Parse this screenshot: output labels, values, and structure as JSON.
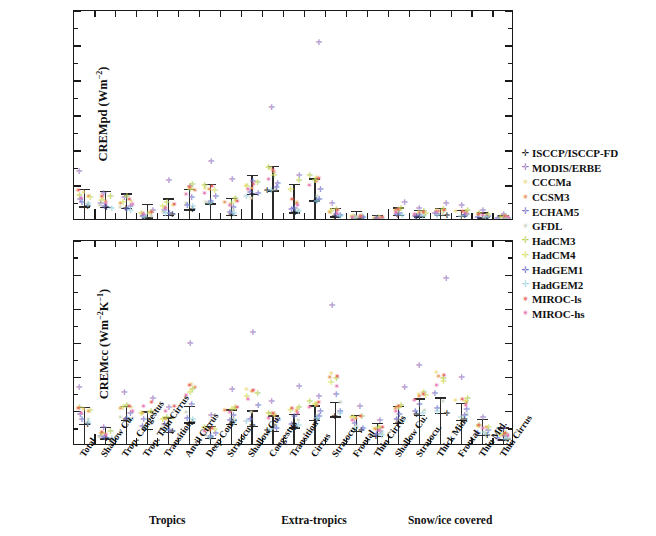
{
  "figure": {
    "panels": [
      {
        "id": "top",
        "ylabel": "CREMpd (Wm",
        "ylabel_sup": "-2",
        "ylabel_tail": ")",
        "ylabel_full": "CREMpd (Wm-2)",
        "yticks": [
          "0",
          "2",
          "4",
          "6",
          "8",
          "10",
          "12"
        ]
      },
      {
        "id": "bottom",
        "ylabel": "CREMcc (Wm",
        "ylabel_sup": "-2",
        "ylabel_mid": "K",
        "ylabel_sup2": "-1",
        "ylabel_tail": ")",
        "ylabel_full": "CREMcc (Wm-2K-1)",
        "yticks": [
          "0.00",
          "0.02",
          "0.04",
          "0.06",
          "0.08",
          "0.10",
          "0.12"
        ]
      }
    ],
    "group_titles": [
      "Tropics",
      "Extra-tropics",
      "Snow/ice covered"
    ],
    "categories": [
      "Total",
      "Shallow Cu.",
      "Trop. Congestus",
      "Trop. Thin Cirrus",
      "Transition",
      "Anvil Cirrus",
      "Deep Conv.",
      "Stratocu.",
      "Shallow Cu.",
      "Congestus",
      "Transition",
      "Cirrus",
      "Stratocu.",
      "Frontal",
      "Thin Cirrus",
      "Shallow Cu.",
      "Stratocu.",
      "Thick Mid.",
      "Frontal",
      "Thin Mid.",
      "Thin Cirrus"
    ]
  },
  "legend": {
    "entries": [
      {
        "label": "ISCCP/ISCCP-FD",
        "color": "#1a1a1a",
        "glyph": "✛"
      },
      {
        "label": "MODIS/ERBE",
        "color": "#9b79c4",
        "glyph": "✛"
      },
      {
        "label": "CCCMa",
        "color": "#ece08a",
        "glyph": "✴"
      },
      {
        "label": "CCSM3",
        "color": "#e8985c",
        "glyph": "✴"
      },
      {
        "label": "ECHAM5",
        "color": "#7a76c8",
        "glyph": "✛"
      },
      {
        "label": "GFDL",
        "color": "#cdd7c2",
        "glyph": "✴"
      },
      {
        "label": "HadCM3",
        "color": "#b7cf52",
        "glyph": "✛"
      },
      {
        "label": "HadCM4",
        "color": "#d4e05e",
        "glyph": "✛"
      },
      {
        "label": "HadGEM1",
        "color": "#6b6fd0",
        "glyph": "✛"
      },
      {
        "label": "HadGEM2",
        "color": "#9fd4e0",
        "glyph": "✛"
      },
      {
        "label": "MIROC-ls",
        "color": "#e8695f",
        "glyph": "✴"
      },
      {
        "label": "MIROC-hs",
        "color": "#e878b4",
        "glyph": "✴"
      }
    ]
  },
  "chart_data": {
    "type": "scatter",
    "title": "",
    "xlabel": "",
    "grid": false,
    "legend_position": "right",
    "model_order": [
      "ISCCP/ISCCP-FD",
      "MODIS/ERBE",
      "CCCMa",
      "CCSM3",
      "ECHAM5",
      "GFDL",
      "HadCM3",
      "HadCM4",
      "HadGEM1",
      "HadGEM2",
      "MIROC-ls",
      "MIROC-hs"
    ],
    "categories": [
      "Total",
      "Shallow Cu.",
      "Trop. Congestus",
      "Trop. Thin Cirrus",
      "Transition",
      "Anvil Cirrus",
      "Deep Conv.",
      "Stratocu.",
      "Shallow Cu.",
      "Congestus",
      "Transition",
      "Cirrus",
      "Stratocu.",
      "Frontal",
      "Thin Cirrus",
      "Shallow Cu.",
      "Stratocu.",
      "Thick Mid.",
      "Frontal",
      "Thin Mid.",
      "Thin Cirrus"
    ],
    "group_spans": [
      [
        0,
        0
      ],
      [
        1,
        7
      ],
      [
        8,
        14
      ],
      [
        15,
        20
      ]
    ],
    "panels": [
      {
        "name": "CREMpd",
        "ylabel": "CREMpd (Wm-2)",
        "ylim": [
          0,
          12
        ],
        "yticks": [
          0,
          2,
          4,
          6,
          8,
          10,
          12
        ],
        "mean": [
          0.8,
          0.78,
          0.7,
          0.18,
          0.32,
          0.62,
          0.98,
          0.33,
          1.5,
          1.72,
          0.45,
          1.15,
          0.22,
          0.14,
          0.08,
          0.3,
          0.22,
          0.3,
          0.26,
          0.17,
          0.1
        ],
        "err_low": [
          0.0,
          0.0,
          0.0,
          0.0,
          0.0,
          0.0,
          0.0,
          0.0,
          0.0,
          0.0,
          0.0,
          0.0,
          0.0,
          0.0,
          0.0,
          0.0,
          0.0,
          0.0,
          0.0,
          0.0,
          0.0
        ],
        "err_high": [
          1.8,
          1.7,
          1.55,
          0.95,
          1.25,
          1.8,
          2.1,
          1.3,
          2.6,
          3.1,
          2.1,
          2.4,
          0.7,
          0.55,
          0.3,
          0.75,
          0.6,
          0.7,
          0.6,
          0.45,
          0.28
        ],
        "points": [
          [
            0.8,
            2.8,
            1.6,
            1.35,
            1.2,
            0.95,
            1.45,
            1.3,
            1.05,
            0.9,
            1.7,
            1.25
          ],
          [
            0.75,
            1.55,
            1.25,
            1.1,
            0.95,
            0.85,
            1.35,
            1.15,
            0.8,
            0.7,
            1.4,
            1.0
          ],
          [
            0.7,
            1.3,
            1.1,
            1.0,
            0.8,
            0.72,
            1.4,
            1.05,
            0.65,
            0.58,
            1.2,
            0.9
          ],
          [
            0.18,
            0.6,
            0.42,
            0.38,
            0.3,
            0.25,
            0.48,
            0.4,
            0.22,
            0.2,
            0.45,
            0.33
          ],
          [
            0.32,
            2.3,
            0.85,
            0.75,
            0.55,
            0.48,
            1.05,
            0.8,
            0.42,
            0.38,
            0.92,
            0.68
          ],
          [
            0.62,
            1.95,
            1.85,
            1.7,
            1.3,
            0.95,
            2.05,
            1.75,
            0.88,
            0.8,
            1.9,
            1.5
          ],
          [
            0.98,
            3.35,
            1.85,
            1.75,
            1.4,
            1.05,
            2.0,
            1.7,
            1.1,
            0.95,
            1.95,
            1.55
          ],
          [
            0.33,
            2.35,
            1.15,
            1.05,
            0.72,
            0.6,
            1.25,
            1.0,
            0.45,
            0.4,
            1.1,
            0.85
          ],
          [
            1.5,
            2.25,
            2.0,
            1.85,
            1.55,
            1.25,
            2.15,
            1.95,
            1.6,
            1.35,
            2.05,
            1.75
          ],
          [
            1.72,
            6.45,
            2.95,
            2.75,
            2.1,
            1.8,
            3.05,
            2.6,
            1.9,
            1.7,
            2.85,
            2.35
          ],
          [
            0.45,
            2.55,
            1.05,
            0.95,
            0.7,
            0.55,
            2.3,
            1.8,
            0.62,
            0.5,
            1.2,
            0.88
          ],
          [
            1.15,
            10.2,
            2.45,
            2.25,
            1.75,
            1.4,
            2.55,
            2.3,
            1.2,
            1.1,
            2.4,
            2.0
          ],
          [
            0.22,
            0.95,
            0.55,
            0.48,
            0.35,
            0.3,
            0.62,
            0.52,
            0.28,
            0.25,
            0.58,
            0.42
          ],
          [
            0.14,
            0.18,
            0.22,
            0.2,
            0.16,
            0.15,
            0.25,
            0.21,
            0.15,
            0.14,
            0.23,
            0.19
          ],
          [
            0.08,
            0.12,
            0.14,
            0.13,
            0.1,
            0.09,
            0.16,
            0.13,
            0.09,
            0.08,
            0.15,
            0.12
          ],
          [
            0.3,
            1.05,
            0.62,
            0.55,
            0.4,
            0.35,
            0.68,
            0.58,
            0.33,
            0.3,
            0.65,
            0.48
          ],
          [
            0.22,
            0.7,
            0.45,
            0.4,
            0.3,
            0.26,
            0.5,
            0.42,
            0.25,
            0.23,
            0.47,
            0.36
          ],
          [
            0.3,
            1.0,
            0.58,
            0.52,
            0.38,
            0.33,
            0.64,
            0.55,
            0.32,
            0.29,
            0.6,
            0.46
          ],
          [
            0.26,
            0.85,
            0.5,
            0.45,
            0.33,
            0.29,
            0.55,
            0.47,
            0.28,
            0.25,
            0.52,
            0.4
          ],
          [
            0.17,
            0.58,
            0.34,
            0.3,
            0.23,
            0.2,
            0.38,
            0.32,
            0.19,
            0.17,
            0.36,
            0.27
          ],
          [
            0.1,
            0.35,
            0.2,
            0.18,
            0.14,
            0.12,
            0.23,
            0.19,
            0.12,
            0.1,
            0.21,
            0.16
          ]
        ]
      },
      {
        "name": "CREMcc",
        "ylabel": "CREMcc (Wm-2K-1)",
        "ylim": [
          0.0,
          0.12
        ],
        "yticks": [
          0.0,
          0.02,
          0.04,
          0.06,
          0.08,
          0.1,
          0.12
        ],
        "mean": [
          0.0125,
          0.004,
          0.015,
          0.0095,
          0.008,
          0.0135,
          0.0045,
          0.0125,
          0.0115,
          0.0085,
          0.0105,
          0.015,
          0.017,
          0.0085,
          0.0055,
          0.013,
          0.018,
          0.019,
          0.015,
          0.006,
          0.0035
        ],
        "err_low": [
          0.0,
          0.0,
          0.0,
          0.0,
          0.0,
          0.0,
          0.0,
          0.0,
          0.0,
          0.0,
          0.0,
          0.0,
          0.0,
          0.0,
          0.0,
          0.0,
          0.0,
          0.0,
          0.0,
          0.0,
          0.0
        ],
        "err_high": [
          0.0225,
          0.011,
          0.023,
          0.02,
          0.0165,
          0.023,
          0.0115,
          0.021,
          0.0205,
          0.0175,
          0.0185,
          0.0235,
          0.0255,
          0.018,
          0.013,
          0.023,
          0.0275,
          0.028,
          0.025,
          0.0155,
          0.0105
        ],
        "points": [
          [
            0.0125,
            0.034,
            0.021,
            0.02,
            0.018,
            0.0155,
            0.0225,
            0.0205,
            0.015,
            0.0135,
            0.0215,
            0.019
          ],
          [
            0.004,
            0.0105,
            0.0072,
            0.0065,
            0.0055,
            0.0048,
            0.008,
            0.0068,
            0.0045,
            0.0042,
            0.0075,
            0.006
          ],
          [
            0.015,
            0.031,
            0.0225,
            0.0215,
            0.019,
            0.0165,
            0.0235,
            0.022,
            0.016,
            0.0145,
            0.023,
            0.02
          ],
          [
            0.0095,
            0.0275,
            0.0195,
            0.0185,
            0.0155,
            0.013,
            0.02,
            0.019,
            0.011,
            0.01,
            0.025,
            0.023
          ],
          [
            0.008,
            0.0225,
            0.016,
            0.015,
            0.0125,
            0.0105,
            0.0165,
            0.0155,
            0.009,
            0.0085,
            0.023,
            0.02
          ],
          [
            0.0135,
            0.06,
            0.036,
            0.034,
            0.024,
            0.0195,
            0.033,
            0.031,
            0.016,
            0.015,
            0.035,
            0.029
          ],
          [
            0.0045,
            0.0175,
            0.0095,
            0.0088,
            0.007,
            0.0058,
            0.0105,
            0.0095,
            0.0052,
            0.0048,
            0.01,
            0.008
          ],
          [
            0.0125,
            0.033,
            0.0215,
            0.0205,
            0.0175,
            0.015,
            0.0225,
            0.021,
            0.0145,
            0.0135,
            0.022,
            0.0195
          ],
          [
            0.0115,
            0.066,
            0.033,
            0.0315,
            0.0235,
            0.0195,
            0.0305,
            0.0285,
            0.015,
            0.014,
            0.032,
            0.027
          ],
          [
            0.0085,
            0.0255,
            0.0185,
            0.0175,
            0.0145,
            0.012,
            0.019,
            0.018,
            0.01,
            0.0095,
            0.0185,
            0.016
          ],
          [
            0.0105,
            0.0345,
            0.021,
            0.02,
            0.017,
            0.0145,
            0.022,
            0.0205,
            0.0125,
            0.0115,
            0.0215,
            0.0185
          ],
          [
            0.015,
            0.0285,
            0.0245,
            0.0235,
            0.02,
            0.0175,
            0.0255,
            0.024,
            0.017,
            0.016,
            0.025,
            0.022
          ],
          [
            0.017,
            0.082,
            0.042,
            0.04,
            0.03,
            0.025,
            0.039,
            0.037,
            0.02,
            0.0185,
            0.0405,
            0.0345
          ],
          [
            0.0085,
            0.023,
            0.0165,
            0.0158,
            0.013,
            0.011,
            0.0172,
            0.0162,
            0.01,
            0.0092,
            0.0168,
            0.0145
          ],
          [
            0.0055,
            0.0145,
            0.01,
            0.0095,
            0.008,
            0.0068,
            0.0108,
            0.0098,
            0.0062,
            0.0058,
            0.0105,
            0.0088
          ],
          [
            0.013,
            0.034,
            0.0225,
            0.0215,
            0.018,
            0.0155,
            0.0235,
            0.022,
            0.015,
            0.014,
            0.023,
            0.02
          ],
          [
            0.018,
            0.047,
            0.03,
            0.0285,
            0.024,
            0.0205,
            0.031,
            0.029,
            0.02,
            0.019,
            0.03,
            0.0265
          ],
          [
            0.019,
            0.098,
            0.0425,
            0.0405,
            0.0305,
            0.0255,
            0.0395,
            0.0375,
            0.0215,
            0.02,
            0.041,
            0.035
          ],
          [
            0.015,
            0.04,
            0.0265,
            0.025,
            0.021,
            0.018,
            0.0275,
            0.026,
            0.0175,
            0.0165,
            0.027,
            0.0235
          ],
          [
            0.006,
            0.0165,
            0.011,
            0.0105,
            0.0088,
            0.0075,
            0.0118,
            0.0108,
            0.0068,
            0.0063,
            0.0115,
            0.0098
          ],
          [
            0.0035,
            0.01,
            0.0065,
            0.006,
            0.005,
            0.0043,
            0.007,
            0.0064,
            0.004,
            0.0037,
            0.0068,
            0.0056
          ]
        ]
      }
    ]
  }
}
